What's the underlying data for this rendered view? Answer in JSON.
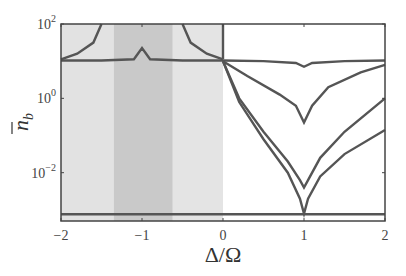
{
  "chart_data": {
    "type": "line",
    "title": "",
    "xlabel": "Δ/Ω",
    "ylabel": "n̄_b",
    "xlim": [
      -2,
      2
    ],
    "ylim_log10": [
      -3.3,
      2
    ],
    "yscale": "log",
    "grid": false,
    "x_ticks": [
      {
        "value": -2,
        "label": "−2"
      },
      {
        "value": -1,
        "label": "−1"
      },
      {
        "value": 0,
        "label": "0"
      },
      {
        "value": 1,
        "label": "1"
      },
      {
        "value": 2,
        "label": "2"
      }
    ],
    "y_ticks": [
      {
        "value": 2,
        "base": "10",
        "exp": "2"
      },
      {
        "value": 0,
        "base": "10",
        "exp": "0"
      },
      {
        "value": -2,
        "base": "10",
        "exp": "−2"
      }
    ],
    "shaded_regions": [
      {
        "x0": -2,
        "x1": -1.35,
        "color": "#e2e2e2"
      },
      {
        "x0": -1.35,
        "x1": -0.62,
        "color": "#c9c9c9"
      },
      {
        "x0": -0.62,
        "x1": 0.0,
        "color": "#e4e4e4"
      }
    ],
    "series": [
      {
        "name": "flat-curve",
        "x": [
          -2,
          -1.5,
          -1.1,
          -1.0,
          -0.9,
          -0.5,
          0,
          0.5,
          0.9,
          1.0,
          1.1,
          1.5,
          2
        ],
        "log10_y": [
          1.02,
          1.02,
          1.05,
          1.35,
          1.05,
          1.02,
          1.02,
          1.0,
          0.95,
          0.85,
          0.95,
          1.0,
          1.02
        ]
      },
      {
        "name": "resonance-left",
        "x": [
          -2,
          -1.8,
          -1.6,
          -1.5
        ],
        "log10_y": [
          1.05,
          1.2,
          1.5,
          2.0
        ]
      },
      {
        "name": "resonance-right",
        "x": [
          -0.5,
          -0.4,
          -0.2,
          0.0
        ],
        "log10_y": [
          2.0,
          1.5,
          1.2,
          1.05
        ]
      },
      {
        "name": "vertical-zero",
        "x": [
          0.0,
          0.0
        ],
        "log10_y": [
          2.0,
          1.05
        ]
      },
      {
        "name": "middle-dip",
        "x": [
          0,
          0.3,
          0.7,
          0.9,
          1.0,
          1.1,
          1.3,
          1.7,
          2
        ],
        "log10_y": [
          1.0,
          0.6,
          0.1,
          -0.2,
          -0.65,
          -0.2,
          0.3,
          0.7,
          0.9
        ]
      },
      {
        "name": "upper-deep",
        "x": [
          0,
          0.2,
          0.5,
          0.8,
          0.95,
          1.0,
          1.05,
          1.2,
          1.5,
          2
        ],
        "log10_y": [
          1.0,
          0.0,
          -0.9,
          -1.7,
          -2.2,
          -2.4,
          -2.2,
          -1.6,
          -0.9,
          0.0
        ]
      },
      {
        "name": "lower-deep",
        "x": [
          0,
          0.2,
          0.5,
          0.8,
          0.95,
          1.0,
          1.05,
          1.2,
          1.5,
          2
        ],
        "log10_y": [
          1.0,
          -0.1,
          -1.1,
          -2.0,
          -2.7,
          -3.1,
          -2.7,
          -2.1,
          -1.5,
          -0.85
        ]
      },
      {
        "name": "bottom-flat",
        "x": [
          -2,
          2
        ],
        "log10_y": [
          -3.12,
          -3.12
        ]
      }
    ]
  }
}
